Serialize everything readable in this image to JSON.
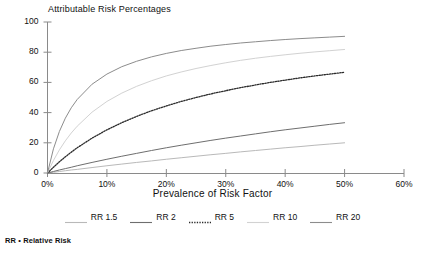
{
  "figure": {
    "title": "Attributable Risk Percentages",
    "footnote": "RR • Relative Risk"
  },
  "axes": {
    "xlabel": "Prevalence of Risk Factor",
    "ylabel": "",
    "yticks": [
      "100",
      "80",
      "60",
      "40",
      "20",
      "0"
    ],
    "xticks": [
      "0%",
      "10%",
      "20%",
      "30%",
      "40%",
      "50%",
      "60%"
    ]
  },
  "legend": {
    "items": [
      {
        "label": "RR 1.5",
        "color": "#b9b9b9",
        "style": "solid"
      },
      {
        "label": "RR 2",
        "color": "#6e6e6e",
        "style": "solid"
      },
      {
        "label": "RR 5",
        "color": "#2b2b2b",
        "style": "dotted"
      },
      {
        "label": "RR 10",
        "color": "#d2d2d2",
        "style": "solid"
      },
      {
        "label": "RR 20",
        "color": "#8c8c8c",
        "style": "solid"
      }
    ]
  },
  "chart_data": {
    "type": "line",
    "title": "Attributable Risk Percentages",
    "xlabel": "Prevalence of Risk Factor",
    "ylabel": "",
    "xlim": [
      0,
      60
    ],
    "ylim": [
      0,
      100
    ],
    "xticks": [
      0,
      10,
      20,
      30,
      40,
      50,
      60
    ],
    "yticks": [
      0,
      20,
      40,
      60,
      80,
      100
    ],
    "xtick_labels": [
      "0%",
      "10%",
      "20%",
      "30%",
      "40%",
      "50%",
      "60%"
    ],
    "grid": false,
    "legend_position": "below",
    "note": "Attributable risk percent AR% = p(RR-1) / (1 + p(RR-1)) x 100, p = prevalence",
    "x": [
      0,
      1,
      2,
      3,
      4,
      5,
      7.5,
      10,
      12.5,
      15,
      17.5,
      20,
      22.5,
      25,
      27.5,
      30,
      32.5,
      35,
      37.5,
      40,
      42.5,
      45,
      47.5,
      50
    ],
    "series": [
      {
        "name": "RR 1.5",
        "relative_risk": 1.5,
        "color": "#b9b9b9",
        "style": "solid",
        "values": [
          0,
          0.5,
          1.0,
          1.5,
          2.0,
          2.4,
          3.6,
          4.8,
          5.9,
          7.0,
          8.0,
          9.1,
          10.1,
          11.1,
          12.1,
          13.0,
          14.0,
          14.9,
          15.8,
          16.7,
          17.5,
          18.4,
          19.2,
          20.0
        ]
      },
      {
        "name": "RR 2",
        "relative_risk": 2,
        "color": "#6e6e6e",
        "style": "solid",
        "values": [
          0,
          1.0,
          2.0,
          2.9,
          3.8,
          4.8,
          7.0,
          9.1,
          11.1,
          13.0,
          14.9,
          16.7,
          18.4,
          20.0,
          21.6,
          23.1,
          24.5,
          25.9,
          27.3,
          28.6,
          29.8,
          31.0,
          32.2,
          33.3
        ]
      },
      {
        "name": "RR 5",
        "relative_risk": 5,
        "color": "#2b2b2b",
        "style": "dotted",
        "values": [
          0,
          3.8,
          7.4,
          10.7,
          13.8,
          16.7,
          23.1,
          28.6,
          33.3,
          37.5,
          41.2,
          44.4,
          47.4,
          50.0,
          52.4,
          54.5,
          56.5,
          58.3,
          60.0,
          61.5,
          63.0,
          64.3,
          65.5,
          66.7
        ]
      },
      {
        "name": "RR 10",
        "relative_risk": 10,
        "color": "#d2d2d2",
        "style": "solid",
        "values": [
          0,
          8.3,
          15.3,
          21.3,
          26.5,
          31.0,
          40.3,
          47.4,
          52.9,
          57.4,
          61.1,
          64.3,
          66.9,
          69.2,
          71.2,
          73.0,
          74.6,
          76.0,
          77.2,
          78.3,
          79.3,
          80.2,
          81.0,
          81.8
        ]
      },
      {
        "name": "RR 20",
        "relative_risk": 20,
        "color": "#8c8c8c",
        "style": "solid",
        "values": [
          0,
          16.0,
          27.5,
          36.3,
          43.2,
          48.7,
          58.8,
          65.5,
          70.4,
          74.0,
          76.9,
          79.2,
          81.1,
          82.6,
          84.0,
          85.1,
          86.1,
          86.9,
          87.7,
          88.4,
          89.0,
          89.5,
          90.0,
          90.5
        ]
      }
    ]
  }
}
